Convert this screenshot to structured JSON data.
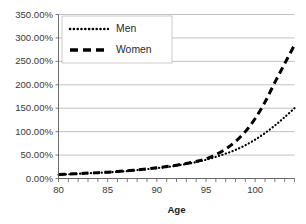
{
  "chart_data": {
    "type": "line",
    "title": "",
    "xlabel": "Age",
    "ylabel": "",
    "xlim": [
      80,
      104
    ],
    "ylim": [
      0,
      350
    ],
    "grid": true,
    "legend_position": "top-left",
    "y_tick_labels": [
      "0.00%",
      "50.00%",
      "100.00%",
      "150.00%",
      "200.00%",
      "250.00%",
      "300.00%",
      "350.00%"
    ],
    "y_tick_values": [
      0,
      50,
      100,
      150,
      200,
      250,
      300,
      350
    ],
    "x_tick_labels": [
      "80",
      "85",
      "90",
      "95",
      "100"
    ],
    "x_tick_values": [
      80,
      85,
      90,
      95,
      100
    ],
    "x": [
      80,
      81,
      82,
      83,
      84,
      85,
      86,
      87,
      88,
      89,
      90,
      91,
      92,
      93,
      94,
      95,
      96,
      97,
      98,
      99,
      100,
      101,
      102,
      103,
      104
    ],
    "series": [
      {
        "name": "Men",
        "style": "dotted",
        "values": [
          8,
          9,
          10,
          11,
          12,
          13,
          14.5,
          16,
          18,
          20,
          22,
          24.5,
          27.5,
          31,
          35,
          40,
          46,
          53,
          61,
          71,
          83,
          97,
          113,
          131,
          150
        ]
      },
      {
        "name": "Women",
        "style": "dashed",
        "values": [
          8.5,
          9.5,
          10.5,
          11.5,
          12.5,
          13.5,
          15,
          16.5,
          18.5,
          20.5,
          23,
          25.5,
          28.5,
          32,
          36.5,
          42,
          51,
          63,
          79,
          100,
          128,
          163,
          205,
          245,
          285
        ]
      }
    ]
  },
  "legend": {
    "items": [
      {
        "label": "Men"
      },
      {
        "label": "Women"
      }
    ]
  },
  "axes": {
    "x_title": "Age"
  }
}
